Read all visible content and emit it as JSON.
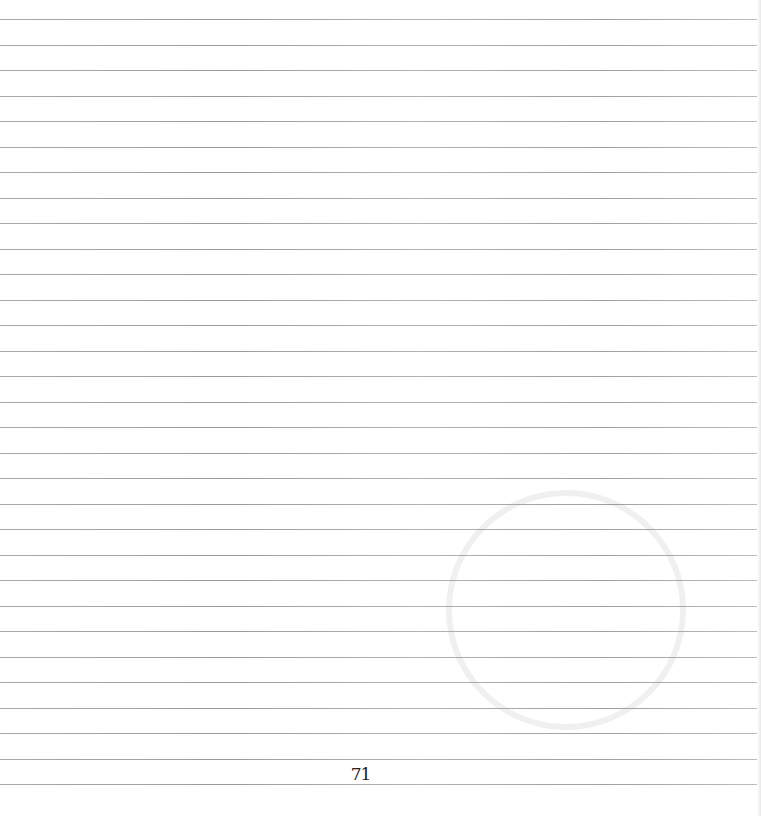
{
  "page": {
    "type": "lined-notebook-page",
    "page_number": "71",
    "rule_count": 31,
    "rule_spacing_px": 25.5,
    "first_rule_y_px": 19,
    "rule_color": "#8e8e8e",
    "background_color": "#ffffff"
  }
}
